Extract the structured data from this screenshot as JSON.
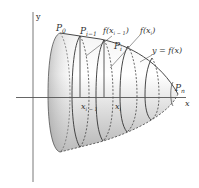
{
  "figure": {
    "axes": {
      "x_label": "x",
      "y_label": "y"
    },
    "points": {
      "p0": "P",
      "p0_sub": "0",
      "pi_minus_1": "P",
      "pi_minus_1_sub": "i−1",
      "pi": "P",
      "pi_sub": "i",
      "pn": "P",
      "pn_sub": "n"
    },
    "x_ticks": {
      "xi_minus_1": "x",
      "xi_minus_1_sub": "i − 1",
      "xi": "x",
      "xi_sub": "i"
    },
    "callouts": {
      "f_xi_minus_1": "f(x",
      "f_xi_minus_1_sub": "i − 1",
      "f_xi_minus_1_close": ")",
      "f_xi": "f(x",
      "f_xi_sub": "i",
      "f_xi_close": ")",
      "curve": "y = f(x)"
    },
    "colors": {
      "axis": "#555555",
      "outline": "#333333",
      "shade_light": "#ffffff",
      "shade_dark": "#b8b8b8"
    }
  }
}
